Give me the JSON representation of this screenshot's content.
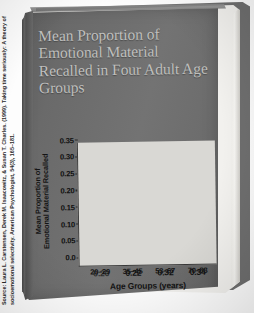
{
  "citation": {
    "text": "Source: Laura L. Carstensen, Derek M. Isaacowitz, & Susan T. Charles. (1999). Taking time seriously: A theory of socioemotional selectivity. American Psychologist, 54(3), 165–181."
  },
  "book": {
    "cover_title": "Mean Proportion of Emotional Material Recalled in Four Adult Age Groups",
    "cover_color": "#6b6b6b",
    "title_color": "#bfbfbd",
    "plot_background": "#d9d8d4"
  },
  "chart_data": {
    "type": "bar",
    "title": "Mean Proportion of Emotional Material Recalled in Four Adult Age Groups",
    "categories": [
      "20–29",
      "35–45",
      "53–67",
      "70–83"
    ],
    "values": [
      0.2,
      0.22,
      0.32,
      0.34
    ],
    "value_labels": [
      "0.20",
      "0.22",
      "0.32",
      "0.34"
    ],
    "bar_colors": [
      "#1a1a1a",
      "#6e6e6e",
      "#9a9a9a",
      "#c6c5c1"
    ],
    "label_colors": [
      "#2e2e2e",
      "#111111",
      "#111111",
      "#111111"
    ],
    "xlabel": "Age Groups (years)",
    "ylabel_line1": "Mean Proportion of",
    "ylabel_line2": "Emotional Material Recalled",
    "ylim": [
      0.0,
      0.37
    ],
    "yticks": [
      "0.0",
      "0.05",
      "0.10",
      "0.15",
      "0.20",
      "0.25",
      "0.30",
      "0.35"
    ],
    "ytick_values": [
      0.0,
      0.05,
      0.1,
      0.15,
      0.2,
      0.25,
      0.3,
      0.35
    ],
    "grid": false,
    "legend": "none"
  }
}
